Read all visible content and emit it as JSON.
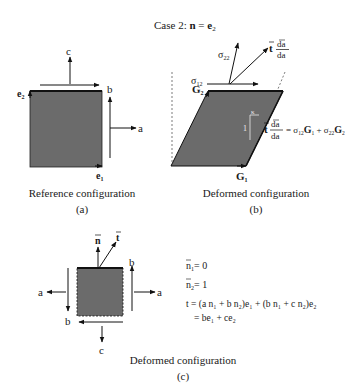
{
  "title": {
    "prefix": "Case 2: ",
    "n": "n",
    "eq": " = ",
    "e": "e",
    "sub": "2"
  },
  "colors": {
    "fill": "#6b6b6b",
    "stroke": "#111111",
    "text": "#1a1a1a",
    "background": "#ffffff"
  },
  "panel_a": {
    "caption": "Reference configuration",
    "label": "(a)",
    "labels": {
      "c": "c",
      "b": "b",
      "a": "a",
      "e2": "e",
      "e2_sub": "2",
      "e1": "e",
      "e1_sub": "1"
    }
  },
  "panel_b": {
    "caption": "Deformed configuration",
    "label": "(b)",
    "labels": {
      "sigma22": "σ",
      "sigma22_sub": "22",
      "sigma12": "σ",
      "sigma12_sub": "12",
      "G2": "G",
      "G2_sub": "2",
      "G1": "G",
      "G1_sub": "1",
      "kappa": "κ",
      "one": "1",
      "t": "t",
      "da_bar": "da",
      "da": "da"
    },
    "equation": {
      "rhs_1": "= σ",
      "rhs_1_sub": "12",
      "rhs_G1": "G",
      "rhs_G1_sub": "1",
      "plus": " + σ",
      "rhs_2_sub": "22",
      "rhs_G2": "G",
      "rhs_G2_sub": "2"
    }
  },
  "panel_c": {
    "caption": "Deformed configuration",
    "label": "(c)",
    "labels": {
      "n": "n",
      "t": "t",
      "a_left": "a",
      "a_right": "a",
      "b_left": "b",
      "b_right": "b",
      "c": "c"
    },
    "equations": [
      {
        "lhs": "n",
        "sub": "1",
        "rhs": "= 0"
      },
      {
        "lhs": "n",
        "sub": "2",
        "rhs": "= 1"
      },
      {
        "text": "t = (a n₁ + b n₂)e₁ + (b n₁ + c n₂)e₂"
      },
      {
        "text": "= be₁ + ce₂"
      }
    ]
  }
}
